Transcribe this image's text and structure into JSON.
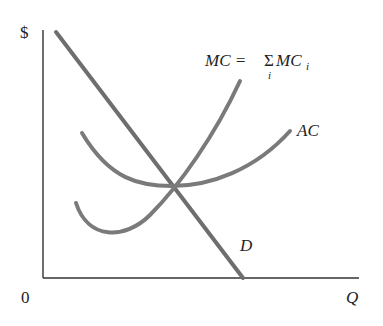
{
  "diagram": {
    "y_axis_label": "$",
    "x_axis_label": "Q",
    "origin_label": "0",
    "curves": [
      {
        "name": "MC",
        "label_main": "MC = ",
        "label_sigma": "Σ",
        "label_sigma_sub": "i",
        "label_mc": "MC",
        "label_mc_sub": "i"
      },
      {
        "name": "AC",
        "label": "AC"
      },
      {
        "name": "D",
        "label": "D"
      }
    ],
    "colors": {
      "curve": "#7a7a7a",
      "axis": "#333333",
      "text": "#222222"
    }
  }
}
